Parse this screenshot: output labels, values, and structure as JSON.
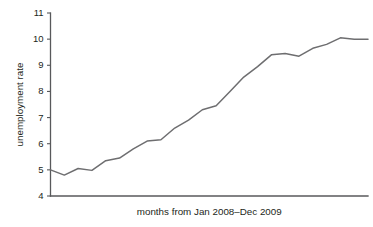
{
  "chart_data": {
    "type": "line",
    "title": "",
    "xlabel": "months from Jan 2008–Dec 2009",
    "ylabel": "unemployment rate",
    "ylim": [
      4,
      11
    ],
    "xlim": [
      1,
      24
    ],
    "grid": false,
    "legend": null,
    "ytick_labels": [
      "4",
      "5",
      "6",
      "7",
      "8",
      "9",
      "10",
      "11"
    ],
    "ytick_values": [
      4,
      5,
      6,
      7,
      8,
      9,
      10,
      11
    ],
    "xtick_labels": [],
    "line_color": "#6e6e70",
    "axis_color": "#58595b",
    "categories": [
      "Jan 2008",
      "Feb 2008",
      "Mar 2008",
      "Apr 2008",
      "May 2008",
      "Jun 2008",
      "Jul 2008",
      "Aug 2008",
      "Sep 2008",
      "Oct 2008",
      "Nov 2008",
      "Dec 2008",
      "Jan 2009",
      "Feb 2009",
      "Mar 2009",
      "Apr 2009",
      "May 2009",
      "Jun 2009",
      "Jul 2009",
      "Aug 2009",
      "Sep 2009",
      "Oct 2009",
      "Nov 2009",
      "Dec 2009"
    ],
    "series": [
      {
        "name": "unemployment rate",
        "values": [
          5.0,
          4.8,
          5.05,
          4.98,
          5.35,
          5.45,
          5.8,
          6.1,
          6.15,
          6.6,
          6.9,
          7.3,
          7.45,
          8.0,
          8.55,
          8.95,
          9.4,
          9.45,
          9.35,
          9.65,
          9.8,
          10.05,
          10.0,
          10.0
        ]
      }
    ]
  }
}
